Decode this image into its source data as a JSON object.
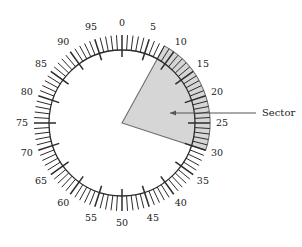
{
  "figure": {
    "type": "polar-dial",
    "background_color": "#ffffff"
  },
  "dial": {
    "center_x": 122,
    "center_y": 123,
    "outer_radius": 88,
    "inner_radius": 73,
    "major_tick_inner_radius": 66,
    "scale_min": 0,
    "scale_max": 100,
    "units_per_revolution": 100,
    "major_tick_interval": 5,
    "minor_tick_interval": 1,
    "zero_at": "top",
    "direction": "clockwise",
    "stroke_color": "#2b2b2b",
    "label_radius": 100,
    "labels": [
      {
        "value": "0",
        "tick": 0
      },
      {
        "value": "5",
        "tick": 5
      },
      {
        "value": "10",
        "tick": 10
      },
      {
        "value": "15",
        "tick": 15
      },
      {
        "value": "20",
        "tick": 20
      },
      {
        "value": "25",
        "tick": 25
      },
      {
        "value": "30",
        "tick": 30
      },
      {
        "value": "35",
        "tick": 35
      },
      {
        "value": "40",
        "tick": 40
      },
      {
        "value": "45",
        "tick": 45
      },
      {
        "value": "50",
        "tick": 50
      },
      {
        "value": "55",
        "tick": 55
      },
      {
        "value": "60",
        "tick": 60
      },
      {
        "value": "65",
        "tick": 65
      },
      {
        "value": "70",
        "tick": 70
      },
      {
        "value": "75",
        "tick": 75
      },
      {
        "value": "80",
        "tick": 80
      },
      {
        "value": "85",
        "tick": 85
      },
      {
        "value": "90",
        "tick": 90
      },
      {
        "value": "95",
        "tick": 95
      }
    ]
  },
  "sector": {
    "label": "Sector",
    "start_value": 8,
    "end_value": 30,
    "span_value": 22,
    "fill_color": "#d6d6d6",
    "edge_color": "#6e6e6e",
    "callout": {
      "text": "Sector",
      "text_x": 262,
      "text_y": 113,
      "line_start_x": 256,
      "line_start_y": 113,
      "line_end_x": 170,
      "line_end_y": 113,
      "arrow_at": "left",
      "color": "#555555"
    }
  },
  "chart_data": {
    "type": "pie",
    "categories": [
      "Sector",
      "Remainder"
    ],
    "values": [
      22,
      78
    ],
    "units": "scale divisions (of 100)",
    "annotations": [
      "Sector"
    ],
    "axis_tick_labels": [
      "0",
      "5",
      "10",
      "15",
      "20",
      "25",
      "30",
      "35",
      "40",
      "45",
      "50",
      "55",
      "60",
      "65",
      "70",
      "75",
      "80",
      "85",
      "90",
      "95"
    ],
    "grid": false,
    "legend": "none"
  }
}
